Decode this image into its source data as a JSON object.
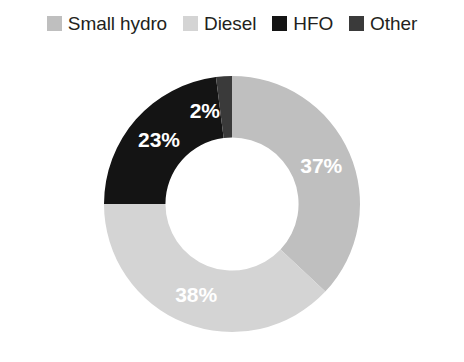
{
  "chart_data": {
    "type": "pie",
    "variant": "donut",
    "title": "",
    "subtitle": "",
    "xlabel": "",
    "ylabel": "",
    "grid": false,
    "legend_position": "top",
    "start_angle_deg": 0,
    "direction": "clockwise",
    "hole_ratio": 0.52,
    "categories": [
      "Small hydro",
      "Diesel",
      "HFO",
      "Other"
    ],
    "values": [
      37,
      38,
      23,
      2
    ],
    "value_unit": "%",
    "data_labels": [
      "37%",
      "38%",
      "23%",
      "2%"
    ],
    "colors": [
      "#bfbfbf",
      "#d4d4d4",
      "#141414",
      "#3a3a3a"
    ],
    "label_color": "#ffffff",
    "slices": [
      {
        "name": "Small hydro",
        "value": 37,
        "label": "37%",
        "color": "#bfbfbf",
        "label_color": "#ffffff"
      },
      {
        "name": "Diesel",
        "value": 38,
        "label": "38%",
        "color": "#d4d4d4",
        "label_color": "#ffffff"
      },
      {
        "name": "HFO",
        "value": 23,
        "label": "23%",
        "color": "#141414",
        "label_color": "#ffffff"
      },
      {
        "name": "Other",
        "value": 2,
        "label": "2%",
        "color": "#3a3a3a",
        "label_color": "#ffffff"
      }
    ]
  },
  "legend": {
    "items": [
      {
        "label": "Small hydro",
        "color": "#bfbfbf"
      },
      {
        "label": "Diesel",
        "color": "#d4d4d4"
      },
      {
        "label": "HFO",
        "color": "#141414"
      },
      {
        "label": "Other",
        "color": "#3a3a3a"
      }
    ]
  },
  "labels": {
    "small_hydro": "37%",
    "diesel": "38%",
    "hfo": "23%",
    "other": "2%"
  }
}
